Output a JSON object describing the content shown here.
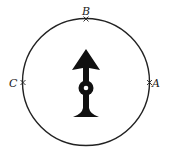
{
  "diagram": {
    "points": [
      {
        "label": "A",
        "position": "right"
      },
      {
        "label": "B",
        "position": "top"
      },
      {
        "label": "C",
        "position": "left"
      }
    ],
    "center_object": "arrow pointing up on pivot",
    "colors": {
      "stroke": "#222222",
      "fill": "#111111",
      "background": "#ffffff"
    }
  }
}
